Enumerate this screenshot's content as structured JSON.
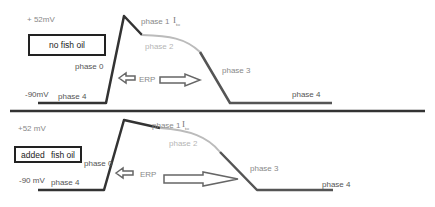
{
  "panel_top": {
    "condition_label": "no fish oil",
    "voltage_max": "+ 52mV",
    "voltage_rest": "-90mV",
    "phases": {
      "phase0": "phase 0",
      "phase1": "phase 1",
      "phase2": "phase 2",
      "phase3": "phase 3",
      "phase4_left": "phase 4",
      "phase4_right": "phase 4"
    },
    "current_label": "I",
    "current_sub": "to",
    "erp_label": "ERP"
  },
  "panel_bottom": {
    "condition_label_1": "added",
    "condition_label_2": "fish oil",
    "voltage_max": "+52 mV",
    "voltage_rest": "-90 mV",
    "phases": {
      "phase0": "phase 0",
      "phase1": "phase 1",
      "phase2": "phase 2",
      "phase3": "phase 3",
      "phase4_left": "phase 4",
      "phase4_right": "phase 4"
    },
    "current_label": "I",
    "current_sub": "to",
    "erp_label": "ERP"
  },
  "colors": {
    "trace_dark": "#333333",
    "trace_light": "#bbbbbb",
    "text": "#555555"
  }
}
